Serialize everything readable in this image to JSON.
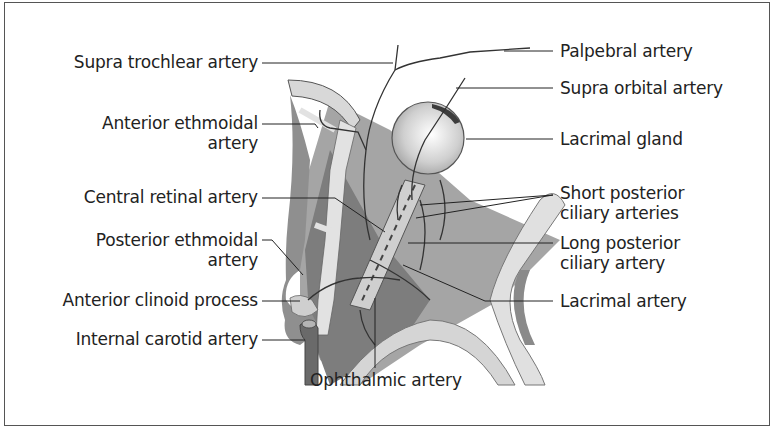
{
  "figure": {
    "colors": {
      "background": "#ffffff",
      "border": "#555555",
      "bone_light": "#d9d9d9",
      "tissue_mid": "#9a9a9a",
      "tissue_dark": "#6e6e6e",
      "leader_line": "#222222",
      "text": "#222222"
    }
  },
  "labels": {
    "left": [
      {
        "id": "supra-trochlear-artery",
        "lines": [
          "Supra trochlear artery"
        ]
      },
      {
        "id": "anterior-ethmoidal-artery",
        "lines": [
          "Anterior ethmoidal",
          "artery"
        ]
      },
      {
        "id": "central-retinal-artery",
        "lines": [
          "Central retinal artery"
        ]
      },
      {
        "id": "posterior-ethmoidal-artery",
        "lines": [
          "Posterior ethmoidal",
          "artery"
        ]
      },
      {
        "id": "anterior-clinoid-process",
        "lines": [
          "Anterior clinoid process"
        ]
      },
      {
        "id": "internal-carotid-artery",
        "lines": [
          "Internal carotid artery"
        ]
      }
    ],
    "right": [
      {
        "id": "palpebral-artery",
        "lines": [
          "Palpebral artery"
        ]
      },
      {
        "id": "supra-orbital-artery",
        "lines": [
          "Supra orbital artery"
        ]
      },
      {
        "id": "lacrimal-gland",
        "lines": [
          "Lacrimal gland"
        ]
      },
      {
        "id": "short-posterior-ciliary-arteries",
        "lines": [
          "Short posterior",
          "ciliary arteries"
        ]
      },
      {
        "id": "long-posterior-ciliary-artery",
        "lines": [
          "Long posterior",
          "ciliary artery"
        ]
      },
      {
        "id": "lacrimal-artery",
        "lines": [
          "Lacrimal artery"
        ]
      }
    ],
    "bottom": [
      {
        "id": "ophthalmic-artery",
        "lines": [
          "Ophthalmic artery"
        ]
      }
    ]
  }
}
